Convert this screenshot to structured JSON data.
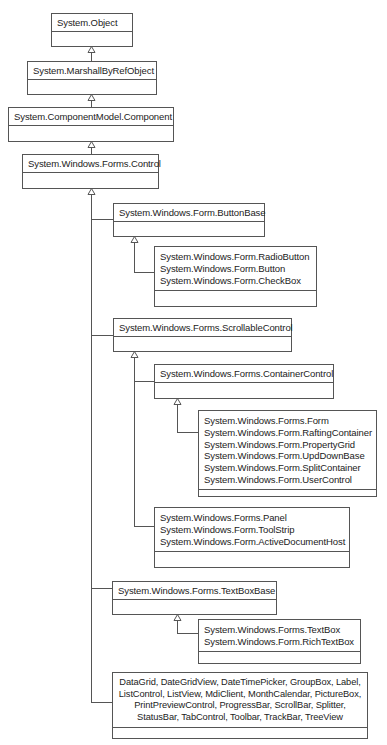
{
  "diagram": {
    "type": "class-hierarchy",
    "nodes": {
      "object": {
        "lines": [
          "System.Object"
        ]
      },
      "marshal": {
        "lines": [
          "System.MarshallByRefObject"
        ]
      },
      "component": {
        "lines": [
          "System.ComponentModel.Component"
        ]
      },
      "control": {
        "lines": [
          "System.Windows.Forms.Control"
        ]
      },
      "buttonbase": {
        "lines": [
          "System.Windows.Form.ButtonBase"
        ]
      },
      "buttons": {
        "lines": [
          "System.Windows.Form.RadioButton",
          "System.Windows.Form.Button",
          "System.Windows.Form.CheckBox"
        ]
      },
      "scrollable": {
        "lines": [
          "System.Windows.Forms.ScrollableControl"
        ]
      },
      "container": {
        "lines": [
          "System.Windows.Forms.ContainerControl"
        ]
      },
      "forms": {
        "lines": [
          "System.Windows.Forms.Form",
          "System.Windows.Form.RaftingContainer",
          "System.Windows.Form.PropertyGrid",
          "System.Windows.Form.UpdDownBase",
          "System.Windows.Form.SplitContainer",
          "System.Windows.Form.UserControl"
        ]
      },
      "panels": {
        "lines": [
          "System.Windows.Forms.Panel",
          "System.Windows.Form.ToolStrip",
          "System.Windows.Form.ActiveDocumentHost"
        ]
      },
      "textboxbase": {
        "lines": [
          "System.Windows.Forms.TextBoxBase"
        ]
      },
      "textboxes": {
        "lines": [
          "System.Windows.Forms.TextBox",
          "System.Windows.Form.RichTextBox"
        ]
      },
      "others": {
        "lines": [
          "DataGrid, DateGridView, DateTimePicker, GroupBox, Label,",
          "ListControl, ListView, MdiClient, MonthCalendar, PictureBox,",
          "PrintPreviewControl, ProgressBar, ScrollBar, Splitter,",
          "StatusBar, TabControl, Toolbar, TrackBar, TreeView"
        ]
      }
    },
    "edges": [
      {
        "from": "marshal",
        "to": "object",
        "kind": "inheritance"
      },
      {
        "from": "component",
        "to": "marshal",
        "kind": "inheritance"
      },
      {
        "from": "control",
        "to": "component",
        "kind": "inheritance"
      },
      {
        "from": "buttonbase",
        "to": "control",
        "kind": "inheritance"
      },
      {
        "from": "scrollable",
        "to": "control",
        "kind": "inheritance"
      },
      {
        "from": "textboxbase",
        "to": "control",
        "kind": "inheritance"
      },
      {
        "from": "others",
        "to": "control",
        "kind": "inheritance"
      },
      {
        "from": "buttons",
        "to": "buttonbase",
        "kind": "inheritance"
      },
      {
        "from": "container",
        "to": "scrollable",
        "kind": "inheritance"
      },
      {
        "from": "panels",
        "to": "scrollable",
        "kind": "inheritance"
      },
      {
        "from": "forms",
        "to": "container",
        "kind": "inheritance"
      },
      {
        "from": "textboxes",
        "to": "textboxbase",
        "kind": "inheritance"
      }
    ],
    "colors": {
      "line": "#555555",
      "text": "#222222",
      "background": "#ffffff"
    }
  }
}
